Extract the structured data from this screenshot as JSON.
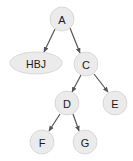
{
  "diagram": {
    "background_color": "#ffffff",
    "node_fill_color": "#ebebeb",
    "node_stroke_color": "#d2d2d2",
    "node_text_color": "#1a1a1a",
    "edge_color": "#555555",
    "nodes": [
      {
        "id": "A",
        "label": "A",
        "shape": "circle",
        "cx": 62,
        "cy": 19,
        "r": 12
      },
      {
        "id": "HBJ",
        "label": "HBJ",
        "shape": "ellipse",
        "cx": 36,
        "cy": 63,
        "rx": 26,
        "ry": 11
      },
      {
        "id": "C",
        "label": "C",
        "shape": "circle",
        "cx": 86,
        "cy": 64,
        "r": 12
      },
      {
        "id": "D",
        "label": "D",
        "shape": "circle",
        "cx": 67,
        "cy": 103,
        "r": 12
      },
      {
        "id": "E",
        "label": "E",
        "shape": "circle",
        "cx": 115,
        "cy": 103,
        "r": 12
      },
      {
        "id": "F",
        "label": "F",
        "shape": "circle",
        "cx": 42,
        "cy": 142,
        "r": 12
      },
      {
        "id": "G",
        "label": "G",
        "shape": "circle",
        "cx": 85,
        "cy": 142,
        "r": 12
      }
    ],
    "edges": [
      {
        "from": "A",
        "to": "HBJ",
        "x1": 55,
        "y1": 29,
        "x2": 44,
        "y2": 52
      },
      {
        "from": "A",
        "to": "C",
        "x1": 70,
        "y1": 28,
        "x2": 80,
        "y2": 53
      },
      {
        "from": "C",
        "to": "D",
        "x1": 81,
        "y1": 75,
        "x2": 72,
        "y2": 92
      },
      {
        "from": "C",
        "to": "E",
        "x1": 94,
        "y1": 74,
        "x2": 108,
        "y2": 92
      },
      {
        "from": "D",
        "to": "F",
        "x1": 60,
        "y1": 114,
        "x2": 49,
        "y2": 131
      },
      {
        "from": "D",
        "to": "G",
        "x1": 73,
        "y1": 114,
        "x2": 79,
        "y2": 131
      }
    ]
  }
}
